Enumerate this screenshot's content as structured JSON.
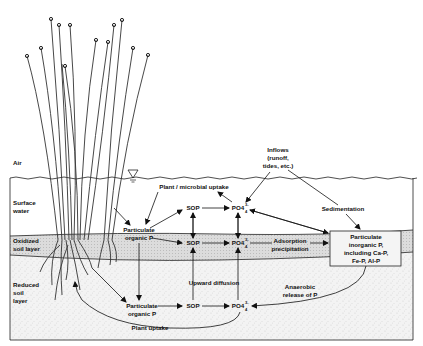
{
  "diagram": {
    "type": "wetland phosphorus cycle",
    "zones": [
      {
        "id": "air",
        "label": "Air"
      },
      {
        "id": "surface_water",
        "label": "Surface water"
      },
      {
        "id": "oxidized",
        "label": "Oxidized soil layer"
      },
      {
        "id": "reduced",
        "label": "Reduced soil layer"
      }
    ],
    "nodes": {
      "inflows": [
        "Inflows",
        "(runoff,",
        "tides, etc.)"
      ],
      "plant_microbial_uptake": "Plant / microbial uptake",
      "particulate_organic_p_water": [
        "Particulate",
        "organic P"
      ],
      "sop_water": "SOP",
      "po4_water": "PO4",
      "sop_oxidized": "SOP",
      "po4_oxidized": "PO4",
      "adsorption": [
        "Adsorption",
        "precipitation"
      ],
      "sedimentation": "Sedimentation",
      "particulate_inorganic_p": [
        "Particulate",
        "inorganic P,",
        "including Ca-P,",
        "Fe-P, Al-P"
      ],
      "upward_diffusion": "Upward diffusion",
      "anaerobic_release": [
        "Anaerobic",
        "release of P"
      ],
      "particulate_organic_p_soil": [
        "Particulate",
        "organic P"
      ],
      "sop_soil": "SOP",
      "po4_soil": "PO4",
      "plant_uptake": "Plant uptake"
    },
    "po4_superscript": "3-",
    "po4_subscript": "4",
    "colors": {
      "line": "#222222",
      "oxidized_fill": "#d9d9d9",
      "reduced_fill": "#efefef",
      "background": "#ffffff"
    }
  }
}
